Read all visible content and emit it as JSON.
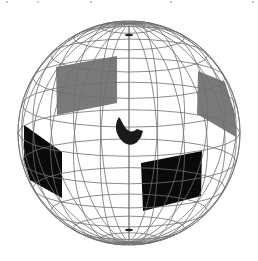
{
  "diagram": {
    "title": "",
    "canvas": {
      "width": 258,
      "height": 261,
      "background": "#ffffff"
    },
    "sphere": {
      "cx": 129,
      "cy": 133,
      "rx": 111,
      "ry": 112,
      "tilt_deg": 12,
      "meridians": 24,
      "parallels": 11,
      "wire_color": "#6e6e6e",
      "north_pole": {
        "x": 129,
        "y": 35
      },
      "south_pole": {
        "x": 129,
        "y": 230
      }
    },
    "panels": [
      {
        "name": "upper-left-gray-panel",
        "color": "#7a7a7a",
        "points": [
          [
            56,
            67
          ],
          [
            117,
            56
          ],
          [
            117,
            103
          ],
          [
            57,
            115
          ]
        ]
      },
      {
        "name": "upper-right-gray-panel",
        "color": "#7a7a7a",
        "points": [
          [
            198,
            71
          ],
          [
            225,
            82
          ],
          [
            235,
            114
          ],
          [
            236,
            137
          ],
          [
            197,
            114
          ]
        ]
      },
      {
        "name": "lower-left-black-panel",
        "color": "#0a0a0a",
        "points": [
          [
            24,
            125
          ],
          [
            62,
            152
          ],
          [
            62,
            198
          ],
          [
            30,
            180
          ],
          [
            24,
            160
          ]
        ]
      },
      {
        "name": "lower-right-black-panel",
        "color": "#0a0a0a",
        "points": [
          [
            141,
            163
          ],
          [
            202,
            151
          ],
          [
            201,
            196
          ],
          [
            143,
            211
          ]
        ]
      }
    ],
    "center_object": {
      "name": "central-crescent-object",
      "color": "#1a1a1a",
      "path": "M119,117 C114,124 115,134 122,141 C127,146 134,146 138,141 L141,137 L143,131 L137,129 C133,133 128,132 125,127 C122,123 121,119 119,117 Z"
    },
    "edge_marks": [
      {
        "x": 6,
        "y": 2
      },
      {
        "x": 37,
        "y": 2
      },
      {
        "x": 90,
        "y": 2
      },
      {
        "x": 170,
        "y": 2
      },
      {
        "x": 252,
        "y": 2
      }
    ]
  }
}
